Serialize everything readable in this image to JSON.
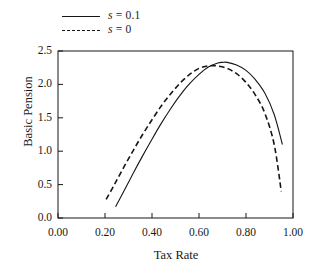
{
  "figure": {
    "background_color": "#ffffff",
    "ink_color": "#161616"
  },
  "legend": {
    "position": "above-plot-left",
    "entries": [
      {
        "label": "s = 0.1",
        "label_prefix": "s",
        "label_suffix": "= 0.1",
        "style": "solid",
        "sample_name": "legend-line-solid"
      },
      {
        "label": "s = 0",
        "label_prefix": "s",
        "label_suffix": "= 0",
        "style": "dashed",
        "sample_name": "legend-line-dashed"
      }
    ]
  },
  "chart_data": {
    "type": "line",
    "title": "",
    "xlabel": "Tax Rate",
    "ylabel": "Basic Pension",
    "xlim": [
      0.0,
      1.0
    ],
    "ylim": [
      0.0,
      2.5
    ],
    "xticks": [
      0.0,
      0.2,
      0.4,
      0.6,
      0.8,
      1.0
    ],
    "xtick_labels": [
      "0.00",
      "0.20",
      "0.40",
      "0.60",
      "0.80",
      "1.00"
    ],
    "yticks": [
      0.0,
      0.5,
      1.0,
      1.5,
      2.0,
      2.5
    ],
    "ytick_labels": [
      "0.0",
      "0.5",
      "1.0",
      "1.5",
      "2.0",
      "2.5"
    ],
    "grid": false,
    "legend_position": "above-axes-left",
    "series": [
      {
        "name": "s = 0.1",
        "style": "solid",
        "color": "#161616",
        "x": [
          0.245,
          0.28,
          0.32,
          0.36,
          0.4,
          0.44,
          0.48,
          0.52,
          0.56,
          0.6,
          0.64,
          0.68,
          0.7,
          0.72,
          0.76,
          0.8,
          0.84,
          0.88,
          0.92,
          0.955
        ],
        "y": [
          0.17,
          0.4,
          0.67,
          0.93,
          1.18,
          1.42,
          1.64,
          1.84,
          2.01,
          2.15,
          2.26,
          2.32,
          2.33,
          2.33,
          2.29,
          2.21,
          2.07,
          1.87,
          1.55,
          1.1
        ]
      },
      {
        "name": "s = 0",
        "style": "dashed",
        "color": "#161616",
        "x": [
          0.205,
          0.24,
          0.28,
          0.32,
          0.36,
          0.4,
          0.44,
          0.48,
          0.52,
          0.56,
          0.6,
          0.635,
          0.655,
          0.68,
          0.72,
          0.76,
          0.8,
          0.84,
          0.88,
          0.92,
          0.95
        ],
        "y": [
          0.28,
          0.5,
          0.76,
          1.01,
          1.25,
          1.47,
          1.68,
          1.86,
          2.02,
          2.15,
          2.24,
          2.275,
          2.28,
          2.275,
          2.24,
          2.16,
          2.03,
          1.84,
          1.57,
          1.1,
          0.4
        ]
      }
    ]
  }
}
